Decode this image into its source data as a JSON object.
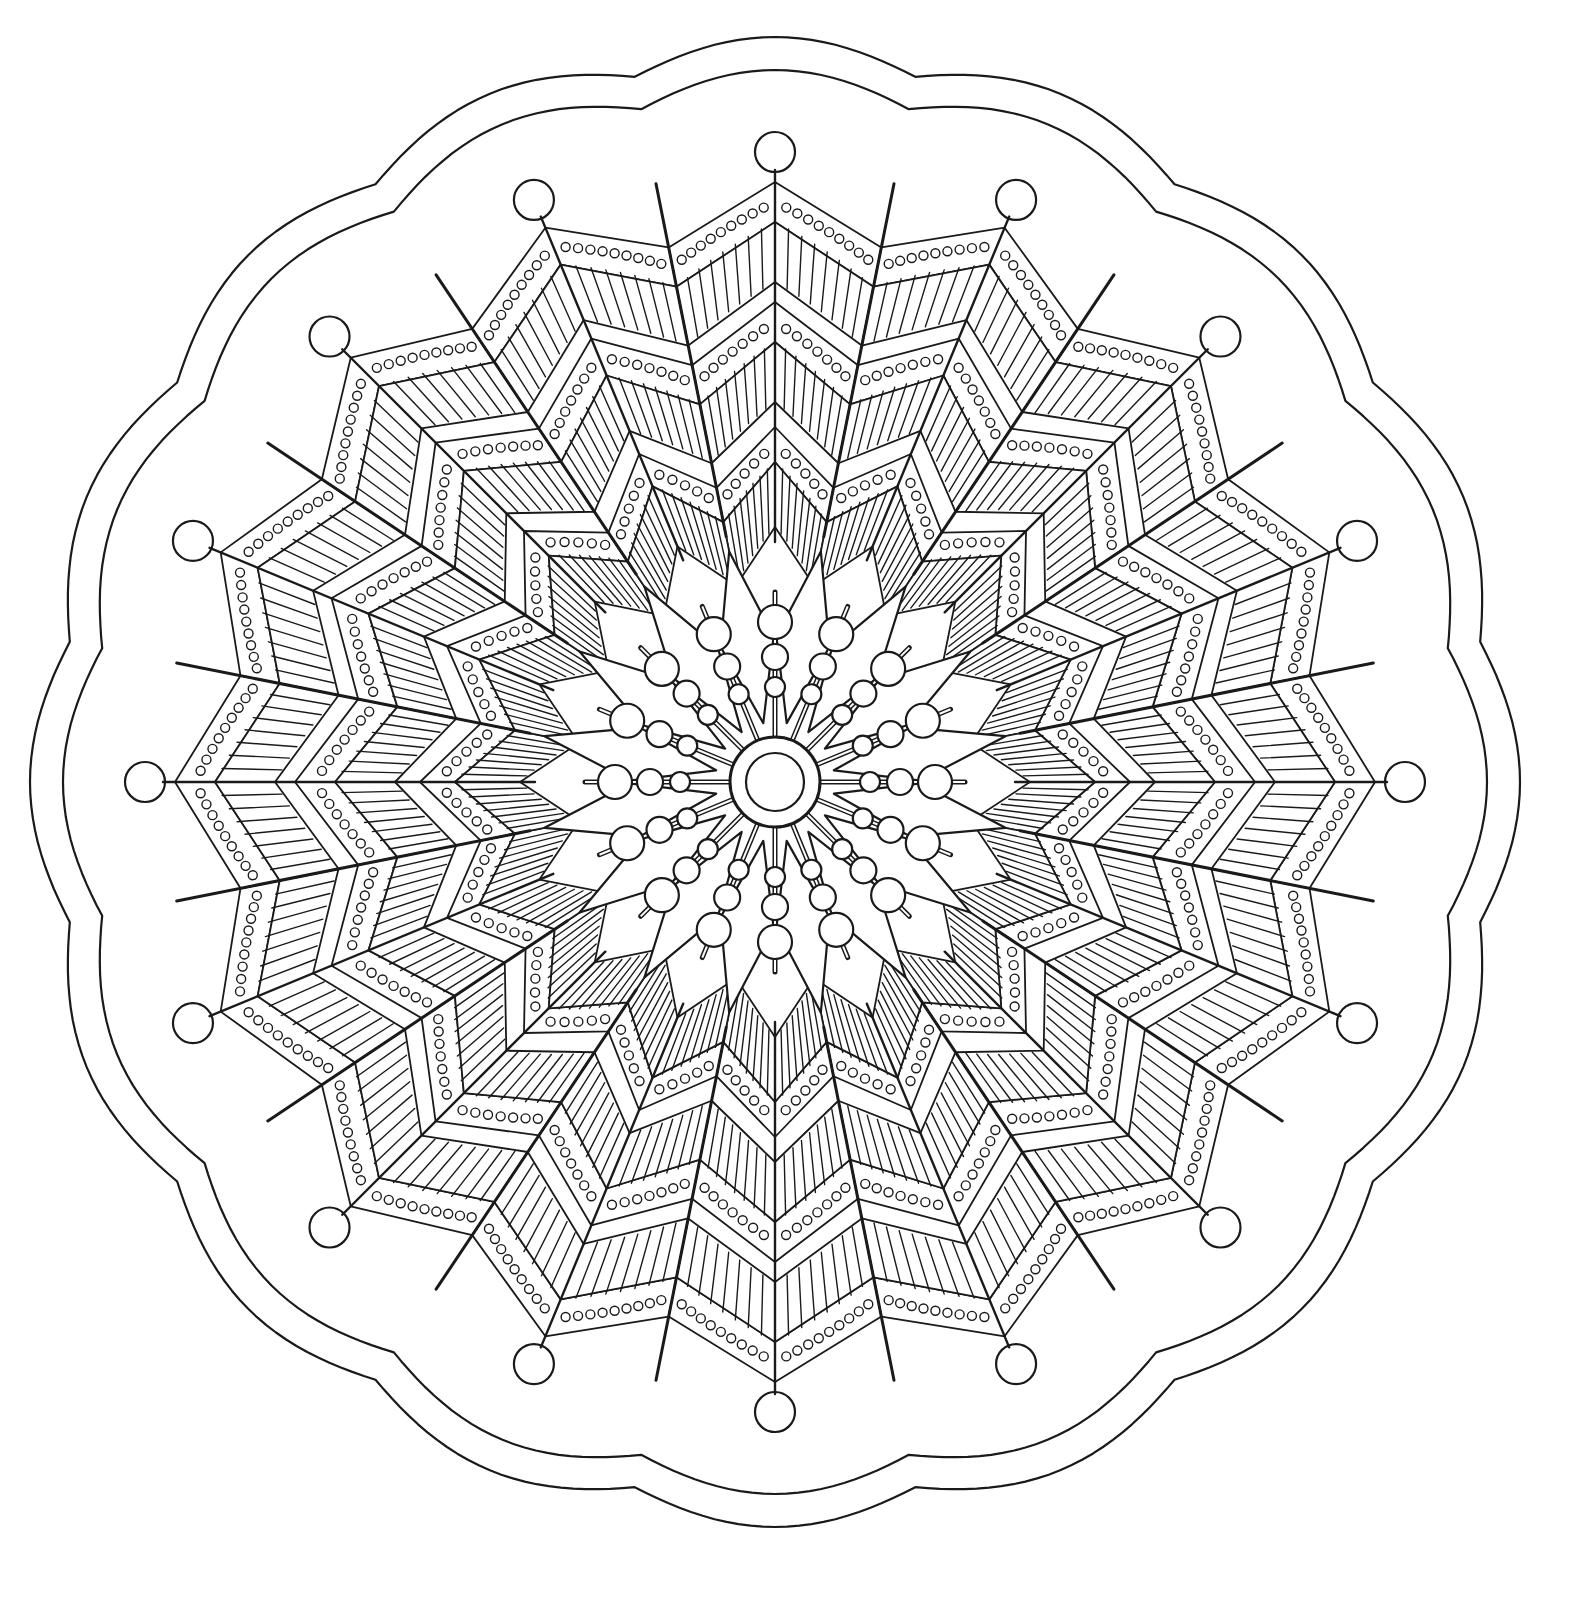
{
  "page": {
    "type": "mandala-coloring-page",
    "background_color": "#ffffff",
    "line_color": "#1a1a1a"
  },
  "mandala": {
    "center": [
      775,
      782
    ],
    "petal_count": 16,
    "outer_border": {
      "scallop_count": 16,
      "outer_radius": 745,
      "inner_radius": 712,
      "scallop_depth": 26
    },
    "outer_beads": {
      "count": 16,
      "radius": 630,
      "bead_size": 20
    },
    "bands": [
      {
        "name": "outer-dotted-band",
        "r_in": 560,
        "r_out": 600,
        "dots": 9
      },
      {
        "name": "outer-hatched-band",
        "r_in": 500,
        "r_out": 560
      },
      {
        "name": "mid-dotted-band",
        "r_in": 440,
        "r_out": 480,
        "dots": 7
      },
      {
        "name": "mid-hatched-band",
        "r_in": 380,
        "r_out": 440
      },
      {
        "name": "inner-dotted-band",
        "r_in": 320,
        "r_out": 355,
        "dots": 5
      },
      {
        "name": "inner-hatched-band",
        "r_in": 255,
        "r_out": 320
      }
    ],
    "inner_flower": {
      "petal_count": 16,
      "r_in": 60,
      "r_out": 235
    },
    "bead_rays": {
      "count": 16,
      "beads": [
        {
          "r": 95,
          "size": 10
        },
        {
          "r": 125,
          "size": 13
        },
        {
          "r": 160,
          "size": 17
        }
      ]
    },
    "center_disc": {
      "outer_radius": 45,
      "inner_radius": 29
    }
  }
}
